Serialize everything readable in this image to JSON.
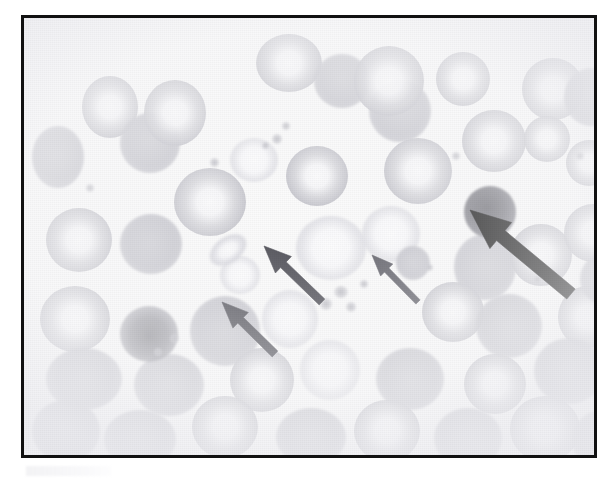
{
  "figure": {
    "kind": "light-micrograph",
    "stain_tone": "pale romanowsky / faded grayscale",
    "border_color": "#111111",
    "background_color": "#fbfbfb",
    "caption_remnant": ""
  },
  "annotations": {
    "arrow_count": 4,
    "arrows": [
      {
        "id": "arrow-1",
        "label": "thick black arrow",
        "points_to": "dark nucleated cell upper right",
        "color": "#0d0d0d",
        "thickness": "thick",
        "direction": "up-left",
        "tip_x": 470,
        "tip_y": 204
      },
      {
        "id": "arrow-2",
        "label": "medium gray arrow",
        "points_to": "pale target cell center",
        "color": "#4a4a52",
        "thickness": "medium",
        "direction": "up-left",
        "tip_x": 264,
        "tip_y": 240
      },
      {
        "id": "arrow-3",
        "label": "medium gray arrow lower",
        "points_to": "cell below center left",
        "color": "#4f4f57",
        "thickness": "medium",
        "direction": "up-left",
        "tip_x": 222,
        "tip_y": 296
      },
      {
        "id": "arrow-4",
        "label": "thin gray arrow",
        "points_to": "small dense cell right of center",
        "color": "#5a5a63",
        "thickness": "thin",
        "direction": "up-left",
        "tip_x": 372,
        "tip_y": 249
      }
    ]
  },
  "cells": {
    "note": "red blood cells, dark nucleated cell, platelet clump and platelet specks rendered as CSS shapes",
    "rbc": [
      {
        "x": 58,
        "y": 58,
        "w": 56,
        "h": 62,
        "type": "rbc"
      },
      {
        "x": 96,
        "y": 95,
        "w": 60,
        "h": 60,
        "type": "rbc-solid"
      },
      {
        "x": 232,
        "y": 16,
        "w": 66,
        "h": 58,
        "type": "rbc"
      },
      {
        "x": 290,
        "y": 36,
        "w": 56,
        "h": 54,
        "type": "rbc-solid"
      },
      {
        "x": 345,
        "y": 62,
        "w": 62,
        "h": 62,
        "type": "rbc-solid"
      },
      {
        "x": 8,
        "y": 108,
        "w": 52,
        "h": 62,
        "type": "rbc-solid"
      },
      {
        "x": 330,
        "y": 28,
        "w": 70,
        "h": 70,
        "type": "rbc"
      },
      {
        "x": 412,
        "y": 34,
        "w": 54,
        "h": 54,
        "type": "rbc"
      },
      {
        "x": 120,
        "y": 62,
        "w": 62,
        "h": 66,
        "type": "rbc"
      },
      {
        "x": 150,
        "y": 150,
        "w": 72,
        "h": 68,
        "type": "rbc"
      },
      {
        "x": 206,
        "y": 120,
        "w": 48,
        "h": 44,
        "type": "rbc-pale"
      },
      {
        "x": 262,
        "y": 128,
        "w": 62,
        "h": 60,
        "type": "rbc"
      },
      {
        "x": 360,
        "y": 120,
        "w": 68,
        "h": 66,
        "type": "rbc"
      },
      {
        "x": 438,
        "y": 92,
        "w": 64,
        "h": 62,
        "type": "rbc"
      },
      {
        "x": 498,
        "y": 40,
        "w": 62,
        "h": 62,
        "type": "rbc"
      },
      {
        "x": 500,
        "y": 98,
        "w": 46,
        "h": 46,
        "type": "rbc"
      },
      {
        "x": 540,
        "y": 50,
        "w": 54,
        "h": 58,
        "type": "rbc-solid"
      },
      {
        "x": 22,
        "y": 190,
        "w": 66,
        "h": 64,
        "type": "rbc"
      },
      {
        "x": 96,
        "y": 196,
        "w": 62,
        "h": 60,
        "type": "rbc-solid"
      },
      {
        "x": 272,
        "y": 198,
        "w": 70,
        "h": 64,
        "type": "rbc-pale"
      },
      {
        "x": 338,
        "y": 188,
        "w": 58,
        "h": 56,
        "type": "rbc-pale"
      },
      {
        "x": 430,
        "y": 216,
        "w": 62,
        "h": 66,
        "type": "rbc-solid"
      },
      {
        "x": 486,
        "y": 206,
        "w": 62,
        "h": 62,
        "type": "rbc"
      },
      {
        "x": 540,
        "y": 186,
        "w": 58,
        "h": 58,
        "type": "rbc"
      },
      {
        "x": 16,
        "y": 268,
        "w": 70,
        "h": 66,
        "type": "rbc"
      },
      {
        "x": 166,
        "y": 278,
        "w": 70,
        "h": 70,
        "type": "rbc-solid"
      },
      {
        "x": 238,
        "y": 272,
        "w": 56,
        "h": 58,
        "type": "rbc-pale"
      },
      {
        "x": 398,
        "y": 264,
        "w": 62,
        "h": 60,
        "type": "rbc"
      },
      {
        "x": 452,
        "y": 276,
        "w": 66,
        "h": 64,
        "type": "rbc-solid"
      },
      {
        "x": 534,
        "y": 268,
        "w": 60,
        "h": 62,
        "type": "rbc"
      },
      {
        "x": 22,
        "y": 330,
        "w": 76,
        "h": 62,
        "type": "rbc-solid"
      },
      {
        "x": 110,
        "y": 336,
        "w": 70,
        "h": 62,
        "type": "rbc-solid"
      },
      {
        "x": 206,
        "y": 330,
        "w": 64,
        "h": 64,
        "type": "rbc"
      },
      {
        "x": 276,
        "y": 322,
        "w": 60,
        "h": 60,
        "type": "rbc-pale"
      },
      {
        "x": 352,
        "y": 330,
        "w": 68,
        "h": 62,
        "type": "rbc-solid"
      },
      {
        "x": 440,
        "y": 336,
        "w": 62,
        "h": 60,
        "type": "rbc"
      },
      {
        "x": 510,
        "y": 320,
        "w": 70,
        "h": 66,
        "type": "rbc-solid"
      },
      {
        "x": 8,
        "y": 382,
        "w": 68,
        "h": 62,
        "type": "rbc-solid"
      },
      {
        "x": 80,
        "y": 392,
        "w": 72,
        "h": 58,
        "type": "rbc-solid"
      },
      {
        "x": 168,
        "y": 378,
        "w": 66,
        "h": 62,
        "type": "rbc"
      },
      {
        "x": 252,
        "y": 390,
        "w": 70,
        "h": 58,
        "type": "rbc-solid"
      },
      {
        "x": 330,
        "y": 382,
        "w": 66,
        "h": 62,
        "type": "rbc"
      },
      {
        "x": 410,
        "y": 390,
        "w": 68,
        "h": 60,
        "type": "rbc-solid"
      },
      {
        "x": 486,
        "y": 378,
        "w": 70,
        "h": 66,
        "type": "rbc"
      },
      {
        "x": 548,
        "y": 392,
        "w": 60,
        "h": 60,
        "type": "rbc-solid"
      },
      {
        "x": 372,
        "y": 228,
        "w": 34,
        "h": 34,
        "type": "rbc-solid"
      },
      {
        "x": 196,
        "y": 238,
        "w": 40,
        "h": 38,
        "type": "rbc-pale"
      },
      {
        "x": 542,
        "y": 122,
        "w": 46,
        "h": 46,
        "type": "rbc"
      },
      {
        "x": 556,
        "y": 236,
        "w": 48,
        "h": 50,
        "type": "rbc-solid"
      }
    ],
    "special": [
      {
        "id": "dark-nucleated-cell",
        "x": 440,
        "y": 168,
        "w": 52,
        "h": 52,
        "type": "dark-cell"
      },
      {
        "id": "platelet-clump",
        "x": 96,
        "y": 288,
        "w": 58,
        "h": 56,
        "type": "clump"
      },
      {
        "id": "elliptocyte",
        "x": 182,
        "y": 218,
        "w": 44,
        "h": 28,
        "type": "ellipto",
        "rotate": -35
      }
    ],
    "platelets": [
      {
        "x": 310,
        "y": 268,
        "w": 14,
        "h": 12
      },
      {
        "x": 322,
        "y": 284,
        "w": 10,
        "h": 10
      },
      {
        "x": 296,
        "y": 280,
        "w": 12,
        "h": 12
      },
      {
        "x": 336,
        "y": 262,
        "w": 8,
        "h": 8
      },
      {
        "x": 248,
        "y": 116,
        "w": 10,
        "h": 10
      },
      {
        "x": 258,
        "y": 104,
        "w": 8,
        "h": 8
      },
      {
        "x": 238,
        "y": 124,
        "w": 7,
        "h": 7
      },
      {
        "x": 146,
        "y": 316,
        "w": 9,
        "h": 9
      },
      {
        "x": 130,
        "y": 330,
        "w": 8,
        "h": 8
      },
      {
        "x": 186,
        "y": 140,
        "w": 9,
        "h": 9
      },
      {
        "x": 428,
        "y": 134,
        "w": 8,
        "h": 8
      },
      {
        "x": 510,
        "y": 258,
        "w": 7,
        "h": 7
      },
      {
        "x": 552,
        "y": 134,
        "w": 8,
        "h": 8
      },
      {
        "x": 62,
        "y": 166,
        "w": 8,
        "h": 8
      },
      {
        "x": 402,
        "y": 246,
        "w": 7,
        "h": 7
      }
    ]
  }
}
